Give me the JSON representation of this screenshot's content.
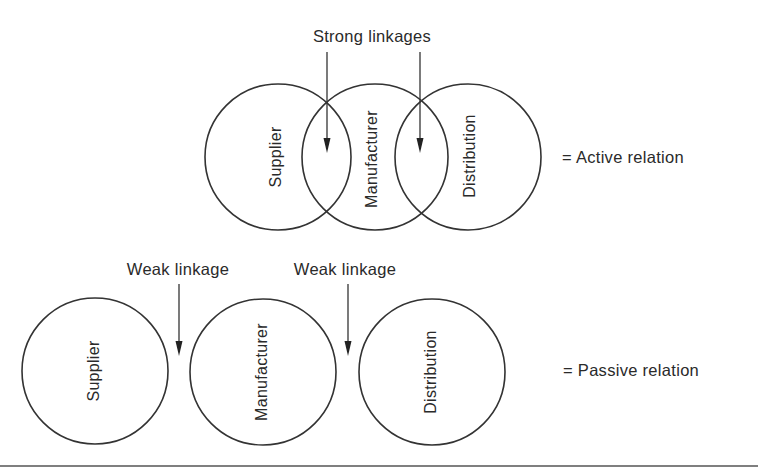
{
  "diagram": {
    "active": {
      "annotation": "Strong linkages",
      "entities": [
        "Supplier",
        "Manufacturer",
        "Distribution"
      ],
      "legend": "= Active relation"
    },
    "passive": {
      "annotations": [
        "Weak linkage",
        "Weak linkage"
      ],
      "entities": [
        "Supplier",
        "Manufacturer",
        "Distribution"
      ],
      "legend": "= Passive relation"
    }
  },
  "colors": {
    "stroke": "#333333",
    "text": "#2a2a2a",
    "background": "#ffffff"
  }
}
